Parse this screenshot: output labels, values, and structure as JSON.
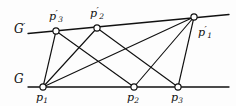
{
  "figure": {
    "type": "geometric-diagram",
    "width": 236,
    "height": 106,
    "background_color": "#fdfdfd",
    "ink_color": "#111111",
    "node_fill_color": "#ffffff",
    "lines": [
      {
        "id": "line-G-prime",
        "label": "G",
        "prime": "′",
        "label_x": 14,
        "label_y": 22,
        "x1": 28,
        "y1": 33.5,
        "x2": 229,
        "y2": 14.5,
        "stroke_width": 1.3
      },
      {
        "id": "line-G",
        "label": "G",
        "prime": "",
        "label_x": 14,
        "label_y": 73,
        "x1": 28,
        "y1": 87,
        "x2": 229,
        "y2": 87,
        "stroke_width": 1.3
      }
    ],
    "nodes": [
      {
        "id": "node-p1",
        "label": "p",
        "sub": "1",
        "prime": "",
        "x": 43,
        "y": 87,
        "r": 3.1,
        "label_x": 36,
        "label_y": 92
      },
      {
        "id": "node-p2",
        "label": "p",
        "sub": "2",
        "prime": "",
        "x": 134,
        "y": 87,
        "r": 3.1,
        "label_x": 127,
        "label_y": 92
      },
      {
        "id": "node-p3",
        "label": "p",
        "sub": "3",
        "prime": "",
        "x": 178,
        "y": 87,
        "r": 3.1,
        "label_x": 171,
        "label_y": 92
      },
      {
        "id": "node-p1-prime",
        "label": "p",
        "sub": "1",
        "prime": "′",
        "x": 194,
        "y": 17,
        "r": 3.1,
        "label_x": 198,
        "label_y": 25
      },
      {
        "id": "node-p2-prime",
        "label": "p",
        "sub": "2",
        "prime": "′",
        "x": 97,
        "y": 28,
        "r": 3.1,
        "label_x": 90,
        "label_y": 6
      },
      {
        "id": "node-p3-prime",
        "label": "p",
        "sub": "3",
        "prime": "′",
        "x": 56,
        "y": 31,
        "r": 3.1,
        "label_x": 49,
        "label_y": 9
      }
    ],
    "edges": [
      {
        "id": "edge-p1-p3prime",
        "from": "p1",
        "to": "p3prime",
        "x1": 43,
        "y1": 87,
        "x2": 56,
        "y2": 31
      },
      {
        "id": "edge-p1-p2prime",
        "from": "p1",
        "to": "p2prime",
        "x1": 43,
        "y1": 87,
        "x2": 97,
        "y2": 28
      },
      {
        "id": "edge-p1-p1prime",
        "from": "p1",
        "to": "p1prime",
        "x1": 43,
        "y1": 87,
        "x2": 194,
        "y2": 17
      },
      {
        "id": "edge-p3prime-p2",
        "from": "p3prime",
        "to": "p2",
        "x1": 56,
        "y1": 31,
        "x2": 134,
        "y2": 87
      },
      {
        "id": "edge-p2prime-p3",
        "from": "p2prime",
        "to": "p3",
        "x1": 97,
        "y1": 28,
        "x2": 178,
        "y2": 87
      },
      {
        "id": "edge-p2-p1prime",
        "from": "p2",
        "to": "p1prime",
        "x1": 134,
        "y1": 87,
        "x2": 194,
        "y2": 17
      },
      {
        "id": "edge-p3-p1prime",
        "from": "p3",
        "to": "p1prime",
        "x1": 178,
        "y1": 87,
        "x2": 194,
        "y2": 17
      }
    ]
  }
}
